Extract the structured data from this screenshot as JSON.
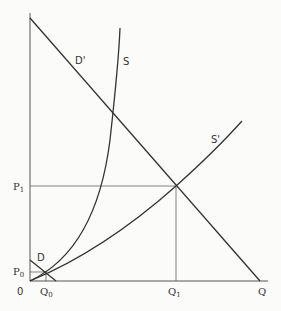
{
  "diagram": {
    "type": "supply-demand",
    "origin_label": "0",
    "axis_x_label": "Q",
    "price_labels": {
      "p0": "P",
      "p0_sub": "0",
      "p1": "P",
      "p1_sub": "1"
    },
    "quantity_labels": {
      "q0": "Q",
      "q0_sub": "0",
      "q1": "Q",
      "q1_sub": "1"
    },
    "curves": {
      "demand_original": "D",
      "demand_shifted": "D'",
      "supply_original": "S",
      "supply_shifted": "S'"
    },
    "colors": {
      "line": "#333333",
      "background": "#fbfbf9"
    }
  }
}
